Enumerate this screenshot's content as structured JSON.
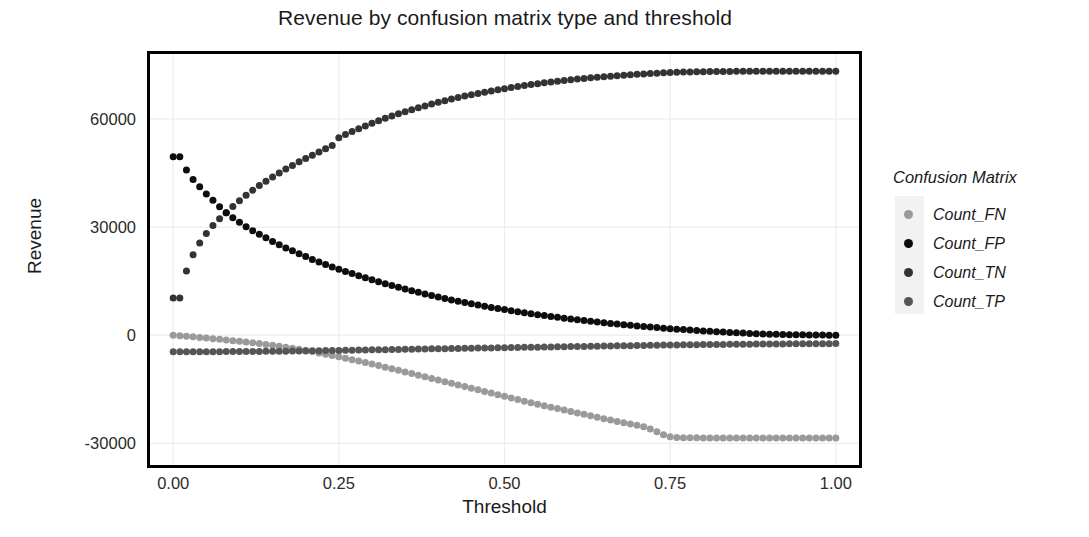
{
  "chart_data": {
    "type": "scatter",
    "title": "Revenue by confusion matrix type and threshold",
    "xlabel": "Threshold",
    "ylabel": "Revenue",
    "xlim": [
      -0.035,
      1.035
    ],
    "ylim": [
      -36000,
      78000
    ],
    "xticks": [
      "0.00",
      "0.25",
      "0.50",
      "0.75",
      "1.00"
    ],
    "xtick_values": [
      0.0,
      0.25,
      0.5,
      0.75,
      1.0
    ],
    "yticks": [
      "60000",
      "30000",
      "0",
      "-30000"
    ],
    "ytick_values": [
      60000,
      30000,
      0,
      -30000
    ],
    "grid": true,
    "legend_title": "Confusion Matrix",
    "legend_position": "right",
    "marker": "circle",
    "marker_size": 7,
    "x": [
      0.0,
      0.01,
      0.02,
      0.03,
      0.04,
      0.05,
      0.06,
      0.07,
      0.08,
      0.09,
      0.1,
      0.11,
      0.12,
      0.13,
      0.14,
      0.15,
      0.16,
      0.17,
      0.18,
      0.19,
      0.2,
      0.21,
      0.22,
      0.23,
      0.24,
      0.25,
      0.26,
      0.27,
      0.28,
      0.29,
      0.3,
      0.31,
      0.32,
      0.33,
      0.34,
      0.35,
      0.36,
      0.37,
      0.38,
      0.39,
      0.4,
      0.41,
      0.42,
      0.43,
      0.44,
      0.45,
      0.46,
      0.47,
      0.48,
      0.49,
      0.5,
      0.51,
      0.52,
      0.53,
      0.54,
      0.55,
      0.56,
      0.57,
      0.58,
      0.59,
      0.6,
      0.61,
      0.62,
      0.63,
      0.64,
      0.65,
      0.66,
      0.67,
      0.68,
      0.69,
      0.7,
      0.71,
      0.72,
      0.73,
      0.74,
      0.75,
      0.76,
      0.77,
      0.78,
      0.79,
      0.8,
      0.81,
      0.82,
      0.83,
      0.84,
      0.85,
      0.86,
      0.87,
      0.88,
      0.89,
      0.9,
      0.91,
      0.92,
      0.93,
      0.94,
      0.95,
      0.96,
      0.97,
      0.98,
      0.99,
      1.0
    ],
    "series": [
      {
        "name": "Count_FN",
        "color": "#9a9a9a",
        "values": [
          0,
          -150,
          -300,
          -450,
          -620,
          -800,
          -980,
          -1150,
          -1330,
          -1520,
          -1700,
          -1900,
          -2100,
          -2320,
          -2550,
          -2800,
          -3050,
          -3330,
          -3620,
          -3900,
          -4200,
          -4550,
          -4900,
          -5250,
          -5600,
          -5980,
          -6380,
          -6780,
          -7180,
          -7580,
          -8000,
          -8430,
          -8860,
          -9300,
          -9750,
          -10200,
          -10650,
          -11100,
          -11550,
          -12000,
          -12450,
          -12900,
          -13350,
          -13800,
          -14250,
          -14700,
          -15150,
          -15600,
          -16050,
          -16500,
          -16950,
          -17400,
          -17850,
          -18300,
          -18750,
          -19150,
          -19550,
          -19950,
          -20350,
          -20750,
          -21150,
          -21550,
          -21950,
          -22350,
          -22750,
          -23150,
          -23550,
          -23900,
          -24250,
          -24600,
          -24950,
          -25400,
          -26000,
          -26800,
          -27600,
          -28150,
          -28350,
          -28420,
          -28450,
          -28470,
          -28480,
          -28490,
          -28495,
          -28500,
          -28500,
          -28500,
          -28500,
          -28500,
          -28500,
          -28500,
          -28500,
          -28500,
          -28500,
          -28500,
          -28500,
          -28500,
          -28500,
          -28500,
          -28500,
          -28500,
          -28500
        ]
      },
      {
        "name": "Count_FP",
        "color": "#0d0d0d",
        "values": [
          49500,
          49500,
          45800,
          43200,
          41200,
          39200,
          37400,
          35600,
          34000,
          32600,
          31300,
          30100,
          29000,
          28000,
          27000,
          26000,
          25100,
          24200,
          23400,
          22600,
          21800,
          21000,
          20300,
          19600,
          18900,
          18300,
          17700,
          17100,
          16500,
          15950,
          15400,
          14850,
          14300,
          13800,
          13300,
          12800,
          12350,
          11900,
          11450,
          11000,
          10600,
          10200,
          9800,
          9420,
          9050,
          8700,
          8360,
          8030,
          7710,
          7400,
          7100,
          6800,
          6510,
          6230,
          5960,
          5700,
          5450,
          5200,
          4960,
          4730,
          4500,
          4280,
          4070,
          3860,
          3660,
          3470,
          3280,
          3100,
          2920,
          2750,
          2580,
          2420,
          2260,
          2110,
          1960,
          1820,
          1680,
          1550,
          1420,
          1300,
          1180,
          1070,
          960,
          860,
          760,
          670,
          580,
          500,
          430,
          360,
          300,
          250,
          200,
          160,
          125,
          95,
          70,
          50,
          32,
          16,
          0
        ]
      },
      {
        "name": "Count_TN",
        "color": "#333333",
        "values": [
          10300,
          10300,
          17800,
          22300,
          25600,
          28200,
          30400,
          32300,
          34000,
          35700,
          37300,
          38800,
          40200,
          41500,
          42700,
          43900,
          45000,
          46100,
          47100,
          48100,
          49000,
          49900,
          50800,
          51700,
          52600,
          54800,
          55700,
          56500,
          57300,
          58050,
          58800,
          59500,
          60150,
          60800,
          61400,
          62000,
          62550,
          63100,
          63600,
          64100,
          64600,
          65050,
          65500,
          65920,
          66320,
          66700,
          67070,
          67420,
          67760,
          68080,
          68390,
          68690,
          68980,
          69250,
          69510,
          69760,
          70000,
          70230,
          70450,
          70660,
          70860,
          71050,
          71230,
          71400,
          71560,
          71710,
          71860,
          72000,
          72130,
          72250,
          72370,
          72480,
          72580,
          72680,
          72770,
          72850,
          72920,
          72980,
          73030,
          73070,
          73100,
          73130,
          73150,
          73170,
          73180,
          73190,
          73200,
          73200,
          73200,
          73200,
          73200,
          73200,
          73200,
          73200,
          73200,
          73200,
          73200,
          73200,
          73200,
          73200,
          73200
        ]
      },
      {
        "name": "Count_TP",
        "color": "#555555",
        "values": [
          -4600,
          -4600,
          -4600,
          -4600,
          -4590,
          -4580,
          -4570,
          -4560,
          -4550,
          -4540,
          -4530,
          -4520,
          -4510,
          -4500,
          -4480,
          -4460,
          -4440,
          -4420,
          -4400,
          -4380,
          -4360,
          -4330,
          -4300,
          -4270,
          -4240,
          -4210,
          -4180,
          -4150,
          -4120,
          -4090,
          -4060,
          -4030,
          -4000,
          -3970,
          -3940,
          -3910,
          -3880,
          -3850,
          -3820,
          -3790,
          -3760,
          -3730,
          -3700,
          -3670,
          -3640,
          -3610,
          -3580,
          -3550,
          -3520,
          -3490,
          -3460,
          -3430,
          -3400,
          -3370,
          -3340,
          -3310,
          -3280,
          -3250,
          -3220,
          -3190,
          -3160,
          -3130,
          -3100,
          -3070,
          -3040,
          -3010,
          -2980,
          -2950,
          -2920,
          -2890,
          -2860,
          -2830,
          -2800,
          -2770,
          -2740,
          -2710,
          -2690,
          -2670,
          -2650,
          -2630,
          -2610,
          -2590,
          -2570,
          -2550,
          -2530,
          -2515,
          -2500,
          -2485,
          -2470,
          -2455,
          -2440,
          -2425,
          -2410,
          -2400,
          -2390,
          -2380,
          -2370,
          -2360,
          -2350,
          -2340,
          -2330
        ]
      }
    ]
  },
  "legend": {
    "title": "Confusion Matrix",
    "items": [
      {
        "label": "Count_FN",
        "color": "#9a9a9a"
      },
      {
        "label": "Count_FP",
        "color": "#0d0d0d"
      },
      {
        "label": "Count_TN",
        "color": "#333333"
      },
      {
        "label": "Count_TP",
        "color": "#555555"
      }
    ]
  },
  "colors": {
    "axis": "#000000",
    "grid": "#ececec",
    "text": "#1a1a1a",
    "tick_text": "#2b2b2b",
    "background": "#ffffff",
    "legend_swatch_bg": "#f2f2f2"
  }
}
